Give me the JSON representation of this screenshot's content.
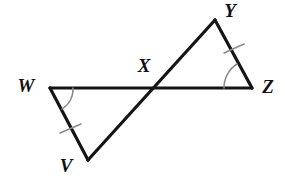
{
  "figure": {
    "kind": "geometry-diagram",
    "background_color": "#ffffff",
    "line_color": "#151515",
    "mark_color": "#8a8a8a",
    "label_color": "#121212",
    "width": 285,
    "height": 178
  },
  "points": {
    "W": {
      "label": "W",
      "x": 50,
      "y": 88,
      "label_x": 26,
      "label_y": 88
    },
    "V": {
      "label": "V",
      "x": 88,
      "y": 160,
      "label_x": 66,
      "label_y": 168
    },
    "X": {
      "label": "X",
      "x": 152,
      "y": 89,
      "label_x": 144,
      "label_y": 68
    },
    "Y": {
      "label": "Y",
      "x": 215,
      "y": 20,
      "label_x": 230,
      "label_y": 13
    },
    "Z": {
      "label": "Z",
      "x": 252,
      "y": 88,
      "label_x": 268,
      "label_y": 89
    }
  },
  "segments": [
    {
      "name": "segment-WZ",
      "from": "W",
      "to": "Z",
      "d": "M 50 88 L 252 88"
    },
    {
      "name": "segment-VY",
      "from": "V",
      "to": "Y",
      "d": "M 88 160 L 215 20"
    },
    {
      "name": "segment-WV",
      "from": "W",
      "to": "V",
      "d": "M 50 88 L 88 160"
    },
    {
      "name": "segment-YZ",
      "from": "Y",
      "to": "Z",
      "d": "M 215 20 L 252 88"
    }
  ],
  "angle_arcs": [
    {
      "name": "angle-arc-W",
      "vertex": "W",
      "d": "M 73 88 A 23 23 0 0 1 62 109"
    },
    {
      "name": "angle-arc-Z",
      "vertex": "Z",
      "d": "M 224 88 A 28 28 0 0 1 237 64"
    }
  ],
  "tick_marks": [
    {
      "name": "tick-mark-WV",
      "on_segment": "segment-WV",
      "d": "M 60 133 L 81 124"
    },
    {
      "name": "tick-mark-YZ",
      "on_segment": "segment-YZ",
      "d": "M 224 53 L 244 44"
    }
  ]
}
